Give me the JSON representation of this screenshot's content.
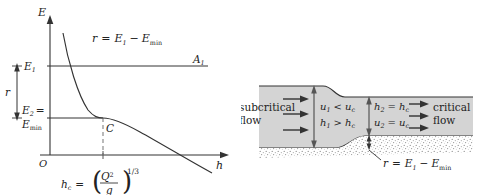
{
  "figure": {
    "colors": {
      "line": "#333333",
      "water_fill": "#d4d4d4",
      "bed_fill": "#efefef",
      "dashed": "#8c8c8c",
      "arrow": "#333333"
    }
  },
  "left_chart": {
    "axes": {
      "y_label": "E",
      "x_label": "h",
      "origin_label": "O"
    },
    "y_ticks": [
      {
        "label": "E",
        "sub": "1",
        "suffix": ""
      },
      {
        "label": "E",
        "sub": "2",
        "suffix": "="
      },
      {
        "label": "E",
        "sub": "min",
        "suffix": ""
      }
    ],
    "bracket_label": "r",
    "annotation_top": {
      "lhs": "r",
      "eq": "=",
      "term1": "E",
      "term1_sub": "1",
      "minus": "−",
      "term2": "E",
      "term2_sub": "min"
    },
    "points": [
      {
        "name": "A",
        "sub": "1"
      },
      {
        "name": "C",
        "sub": ""
      }
    ],
    "x_annotation": {
      "lhs": "h",
      "lhs_sub": "c",
      "eq": "=",
      "numerator": "Q",
      "numerator_sup": "2",
      "denominator": "g",
      "exponent": "1/3"
    }
  },
  "right_diagram": {
    "left_label_line1": "subcritical",
    "left_label_line2": "flow",
    "right_label_line1": "critical",
    "right_label_line2": "flow",
    "upstream": {
      "velocity": {
        "lhs": "u",
        "lhs_sub": "1",
        "rel": "<",
        "rhs": "u",
        "rhs_sub": "c"
      },
      "depth": {
        "lhs": "h",
        "lhs_sub": "1",
        "rel": ">",
        "rhs": "h",
        "rhs_sub": "c"
      }
    },
    "downstream": {
      "depth": {
        "lhs": "h",
        "lhs_sub": "2",
        "rel": "=",
        "rhs": "h",
        "rhs_sub": "c"
      },
      "velocity": {
        "lhs": "u",
        "lhs_sub": "2",
        "rel": "=",
        "rhs": "u",
        "rhs_sub": "c"
      }
    },
    "step_annotation": {
      "lhs": "r",
      "eq": "=",
      "term1": "E",
      "term1_sub": "1",
      "minus": "−",
      "term2": "E",
      "term2_sub": "min"
    }
  }
}
